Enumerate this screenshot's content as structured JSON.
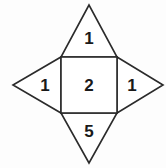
{
  "figure": {
    "name": "square-with-four-triangles",
    "background_color": "#fdfdfd",
    "stroke_color": "#2b2b2b",
    "fill_color": "#ffffff",
    "text_color": "#1a1a1a",
    "canvas": {
      "width": 166,
      "height": 168
    },
    "square": {
      "label": "2",
      "left": 61,
      "top": 57,
      "right": 117,
      "bottom": 113,
      "label_x": 89,
      "label_y": 85
    },
    "triangles": [
      {
        "position": "top",
        "label": "1",
        "apex_x": 89,
        "apex_y": 5,
        "base_x1": 61,
        "base_y1": 57,
        "base_x2": 117,
        "base_y2": 57,
        "label_x": 89,
        "label_y": 38
      },
      {
        "position": "left",
        "label": "1",
        "apex_x": 13,
        "apex_y": 85,
        "base_x1": 61,
        "base_y1": 57,
        "base_x2": 61,
        "base_y2": 113,
        "label_x": 45,
        "label_y": 85
      },
      {
        "position": "right",
        "label": "1",
        "apex_x": 163,
        "apex_y": 85,
        "base_x1": 117,
        "base_y1": 57,
        "base_x2": 117,
        "base_y2": 113,
        "label_x": 132,
        "label_y": 85
      },
      {
        "position": "bottom",
        "label": "5",
        "apex_x": 89,
        "apex_y": 163,
        "base_x1": 61,
        "base_y1": 113,
        "base_x2": 117,
        "base_y2": 113,
        "label_x": 89,
        "label_y": 131
      }
    ]
  }
}
